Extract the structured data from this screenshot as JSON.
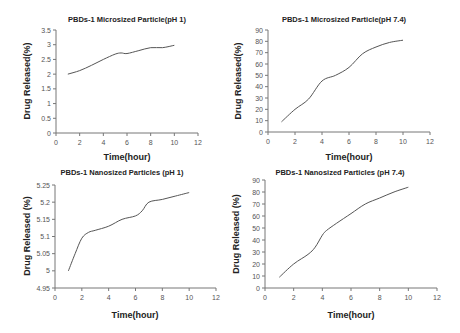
{
  "chart_data": [
    {
      "type": "line",
      "title": "PBDs-1 Microsized Particle(pH 1)",
      "xlabel": "Time(hour)",
      "ylabel": "Drug Released(%)",
      "xlim": [
        0,
        12
      ],
      "ylim": [
        0,
        3.5
      ],
      "xticks": [
        0,
        2,
        4,
        6,
        8,
        10,
        12
      ],
      "yticks": [
        0,
        0.5,
        1,
        1.5,
        2,
        2.5,
        3,
        3.5
      ],
      "ytick_labels": [
        "0",
        "0.5",
        "1",
        "1.5",
        "2",
        "2.5",
        "3",
        "3.5"
      ],
      "grid": false,
      "x": [
        1,
        2,
        3,
        4,
        5,
        5.5,
        6,
        7,
        8,
        9,
        10
      ],
      "values": [
        2.0,
        2.12,
        2.3,
        2.5,
        2.68,
        2.72,
        2.7,
        2.8,
        2.9,
        2.9,
        2.98
      ]
    },
    {
      "type": "line",
      "title": "PBDs-1 Microsized Particle(pH 7.4)",
      "xlabel": "Time(hour)",
      "ylabel": "Drug Released(%)",
      "xlim": [
        0,
        12
      ],
      "ylim": [
        0,
        90
      ],
      "xticks": [
        0,
        2,
        4,
        6,
        8,
        10,
        12
      ],
      "yticks": [
        0,
        10,
        20,
        30,
        40,
        50,
        60,
        70,
        80,
        90
      ],
      "ytick_labels": [
        "0",
        "10",
        "20",
        "30",
        "40",
        "50",
        "60",
        "70",
        "80",
        "90"
      ],
      "grid": false,
      "x": [
        1,
        2,
        3,
        4,
        5,
        6,
        7,
        8,
        9,
        10
      ],
      "values": [
        9,
        20,
        29,
        45,
        50,
        57,
        69,
        75,
        79,
        81
      ]
    },
    {
      "type": "line",
      "title": "PBDs-1 Nanosized Particles (pH 1)",
      "xlabel": "Time(hour)",
      "ylabel": "Drug Released (%)",
      "xlim": [
        0,
        12
      ],
      "ylim": [
        4.95,
        5.25
      ],
      "xticks": [
        0,
        2,
        4,
        6,
        8,
        10,
        12
      ],
      "yticks": [
        4.95,
        5.0,
        5.05,
        5.1,
        5.15,
        5.2,
        5.25
      ],
      "ytick_labels": [
        "4.95",
        "5",
        "5.05",
        "5.1",
        "5.15",
        "5.2",
        "5.25"
      ],
      "grid": false,
      "x": [
        1,
        1.5,
        2,
        2.5,
        3,
        4,
        5,
        6,
        6.5,
        7,
        8,
        9,
        10
      ],
      "values": [
        5.0,
        5.05,
        5.095,
        5.112,
        5.118,
        5.13,
        5.15,
        5.16,
        5.175,
        5.2,
        5.208,
        5.218,
        5.228
      ]
    },
    {
      "type": "line",
      "title": "PBDs-1 Nanosized Particles (pH 7.4)",
      "xlabel": "Time(hour)",
      "ylabel": "Drug Released (%)",
      "xlim": [
        0,
        12
      ],
      "ylim": [
        0,
        90
      ],
      "xticks": [
        0,
        2,
        4,
        6,
        8,
        10,
        12
      ],
      "yticks": [
        0,
        10,
        20,
        30,
        40,
        50,
        60,
        70,
        80,
        90
      ],
      "ytick_labels": [
        "0",
        "10",
        "20",
        "30",
        "40",
        "50",
        "60",
        "70",
        "80",
        "90"
      ],
      "grid": false,
      "x": [
        1,
        2,
        3,
        3.5,
        4,
        4.3,
        5,
        6,
        7,
        8,
        9,
        10
      ],
      "values": [
        9,
        20,
        28,
        34,
        44,
        48,
        54,
        62,
        70,
        75,
        80,
        84
      ]
    }
  ],
  "panels": [
    {
      "title": "PBDs-1 Microsized Particle(pH 1)",
      "xlabel": "Time(hour)",
      "ylabel": "Drug Released(%)"
    },
    {
      "title": "PBDs-1 Microsized Particle(pH 7.4)",
      "xlabel": "Time(hour)",
      "ylabel": "Drug Released(%)"
    },
    {
      "title": "PBDs-1 Nanosized Particles (pH 1)",
      "xlabel": "Time(hour)",
      "ylabel": "Drug Released (%)"
    },
    {
      "title": "PBDs-1 Nanosized Particles (pH 7.4)",
      "xlabel": "Time(hour)",
      "ylabel": "Drug Released (%)"
    }
  ],
  "layout": [
    {
      "x0": 56,
      "x1": 198,
      "y0": 133,
      "y1": 30,
      "title_y": 22,
      "xlabel_y": 160,
      "ylabel_x": 30
    },
    {
      "x0": 268,
      "x1": 430,
      "y0": 132,
      "y1": 30,
      "title_y": 22,
      "xlabel_y": 160,
      "ylabel_x": 241
    },
    {
      "x0": 55,
      "x1": 216,
      "y0": 288,
      "y1": 185,
      "title_y": 175,
      "xlabel_y": 318,
      "ylabel_x": 30
    },
    {
      "x0": 265,
      "x1": 437,
      "y0": 288,
      "y1": 180,
      "title_y": 175,
      "xlabel_y": 318,
      "ylabel_x": 239
    }
  ]
}
